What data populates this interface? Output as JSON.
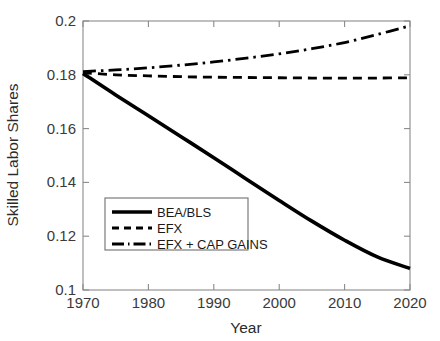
{
  "chart_data": {
    "type": "line",
    "title": "",
    "xlabel": "Year",
    "ylabel": "Skilled Labor Shares",
    "xlim": [
      1970,
      2020
    ],
    "ylim": [
      0.1,
      0.2
    ],
    "xticks": [
      "1970",
      "1980",
      "1990",
      "2000",
      "2010",
      "2020"
    ],
    "xtick_values": [
      1970,
      1980,
      1990,
      2000,
      2010,
      2020
    ],
    "yticks": [
      "0.1",
      "0.12",
      "0.14",
      "0.16",
      "0.18",
      "0.2"
    ],
    "ytick_values": [
      0.1,
      0.12,
      0.14,
      0.16,
      0.18,
      0.2
    ],
    "grid": false,
    "legend_position": "center-left",
    "x": [
      1970,
      1975,
      1980,
      1985,
      1990,
      1995,
      2000,
      2005,
      2010,
      2015,
      2020
    ],
    "series": [
      {
        "name": "BEA/BLS",
        "style": "solid",
        "color": "#000000",
        "values": [
          0.1805,
          0.1725,
          0.1648,
          0.157,
          0.1492,
          0.1412,
          0.1333,
          0.1256,
          0.1185,
          0.1123,
          0.108
        ]
      },
      {
        "name": "EFX",
        "style": "dashed",
        "color": "#000000",
        "values": [
          0.1808,
          0.18,
          0.1796,
          0.1793,
          0.1791,
          0.179,
          0.1789,
          0.1788,
          0.1788,
          0.1788,
          0.1789
        ]
      },
      {
        "name": "EFX + CAP GAINS",
        "style": "dash-dot",
        "color": "#000000",
        "values": [
          0.1812,
          0.1818,
          0.1826,
          0.1836,
          0.1848,
          0.1862,
          0.1878,
          0.1897,
          0.192,
          0.195,
          0.1982
        ]
      }
    ]
  },
  "legend": {
    "entries": [
      {
        "label": "BEA/BLS"
      },
      {
        "label": "EFX"
      },
      {
        "label": "EFX + CAP GAINS"
      }
    ]
  },
  "axes": {
    "x_title": "Year",
    "y_title": "Skilled Labor Shares"
  }
}
